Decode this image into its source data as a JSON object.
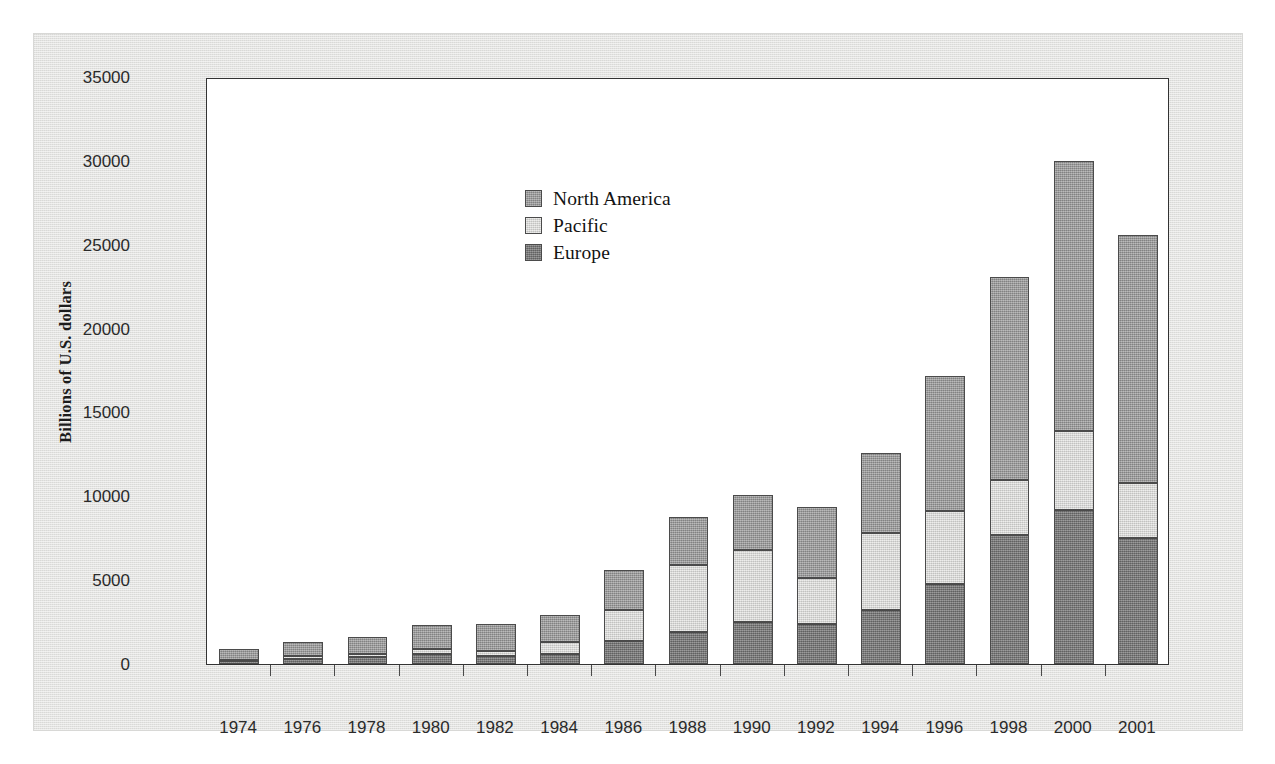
{
  "figure": {
    "ylabel": "Billions of U.S. dollars",
    "colors": {
      "north_america": "#9d9d9d",
      "pacific": "#dededc",
      "europe": "#7b7b7b",
      "frame": "#333333",
      "panel_background": "#e3e3e1"
    }
  },
  "legend": {
    "position": "inside-top-left",
    "entries": [
      {
        "label": "North America",
        "swatch": "north-america-swatch"
      },
      {
        "label": "Pacific",
        "swatch": "pacific-swatch"
      },
      {
        "label": "Europe",
        "swatch": "europe-swatch"
      }
    ]
  },
  "chart_data": {
    "type": "bar",
    "stacked": true,
    "title": "",
    "xlabel": "",
    "ylabel": "Billions of U.S. dollars",
    "ylim": [
      0,
      35000
    ],
    "ytick_labels": [
      "0",
      "5000",
      "10000",
      "15000",
      "20000",
      "25000",
      "30000",
      "35000"
    ],
    "ytick_values": [
      0,
      5000,
      10000,
      15000,
      20000,
      25000,
      30000,
      35000
    ],
    "grid": false,
    "legend_position": "upper left (inside axes)",
    "categories": [
      "1974",
      "1976",
      "1978",
      "1980",
      "1982",
      "1984",
      "1986",
      "1988",
      "1990",
      "1992",
      "1994",
      "1996",
      "1998",
      "2000",
      "2001"
    ],
    "series": [
      {
        "name": "Europe",
        "color": "#7b7b7b",
        "values": [
          150,
          300,
          400,
          600,
          500,
          600,
          1400,
          1900,
          2500,
          2400,
          3200,
          4800,
          7700,
          9200,
          7500
        ]
      },
      {
        "name": "Pacific",
        "color": "#dededc",
        "values": [
          100,
          150,
          200,
          300,
          300,
          700,
          1800,
          4000,
          4300,
          2700,
          4600,
          4300,
          3250,
          4700,
          3300
        ]
      },
      {
        "name": "North America",
        "color": "#9d9d9d",
        "values": [
          650,
          860,
          1000,
          1450,
          1600,
          1600,
          2400,
          2850,
          3300,
          4250,
          4800,
          8100,
          12150,
          16100,
          14800
        ]
      }
    ],
    "totals": [
      900,
      1310,
      1600,
      2350,
      2400,
      2900,
      5600,
      8750,
      10100,
      9350,
      12600,
      17200,
      23100,
      30000,
      25600
    ]
  }
}
